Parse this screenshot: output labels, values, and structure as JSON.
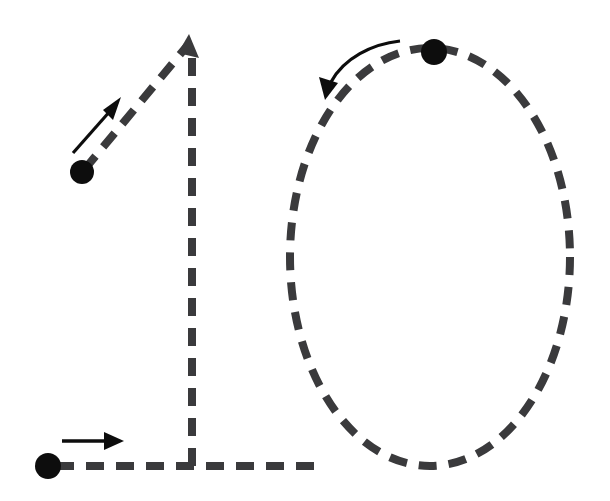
{
  "page": {
    "width": 610,
    "height": 501,
    "background_color": "#ffffff"
  },
  "style": {
    "stroke_color": "#3a3a3c",
    "dot_color": "#0d0d0d",
    "arrow_color": "#0d0d0d",
    "stroke_width": 8,
    "dash_length": 18,
    "dash_gap": 12
  },
  "figures": [
    {
      "name": "digit-one",
      "label": "1",
      "strokes": [
        {
          "name": "diagonal-flag-stroke",
          "order": 1,
          "type": "line",
          "dashed": true,
          "start": [
            82,
            172
          ],
          "end": [
            190,
            42
          ],
          "start_dot": [
            82,
            172
          ],
          "end_marker": "arrowhead-up"
        },
        {
          "name": "vertical-stem-stroke",
          "order": 2,
          "type": "line",
          "dashed": true,
          "start": [
            192,
            48
          ],
          "end": [
            192,
            466
          ],
          "start_dot": null,
          "end_marker": "none"
        },
        {
          "name": "base-horizontal-stroke",
          "order": 3,
          "type": "line",
          "dashed": true,
          "start": [
            48,
            466
          ],
          "end": [
            320,
            466
          ],
          "start_dot": [
            48,
            466
          ],
          "end_marker": "none"
        }
      ],
      "direction_arrows": [
        {
          "name": "diagonal-direction-arrow",
          "type": "straight",
          "from": [
            74,
            152
          ],
          "to": [
            120,
            98
          ],
          "direction": "up-right"
        },
        {
          "name": "baseline-direction-arrow",
          "type": "straight",
          "from": [
            62,
            441
          ],
          "to": [
            123,
            441
          ],
          "direction": "right"
        }
      ]
    },
    {
      "name": "digit-zero",
      "label": "0",
      "strokes": [
        {
          "name": "oval-stroke",
          "order": 1,
          "type": "ellipse",
          "dashed": true,
          "center": [
            430,
            257
          ],
          "rx": 140,
          "ry": 209,
          "start_dot": [
            434,
            52
          ],
          "end_marker": "none"
        }
      ],
      "direction_arrows": [
        {
          "name": "oval-direction-arrow",
          "type": "curved",
          "from": [
            400,
            40
          ],
          "to": [
            330,
            95
          ],
          "direction": "counter-clockwise"
        }
      ]
    }
  ],
  "dots": [
    {
      "name": "start-dot-diagonal",
      "cx": 82,
      "cy": 172,
      "r": 12
    },
    {
      "name": "start-dot-baseline",
      "cx": 48,
      "cy": 466,
      "r": 13
    },
    {
      "name": "start-dot-oval",
      "cx": 434,
      "cy": 52,
      "r": 13
    }
  ]
}
